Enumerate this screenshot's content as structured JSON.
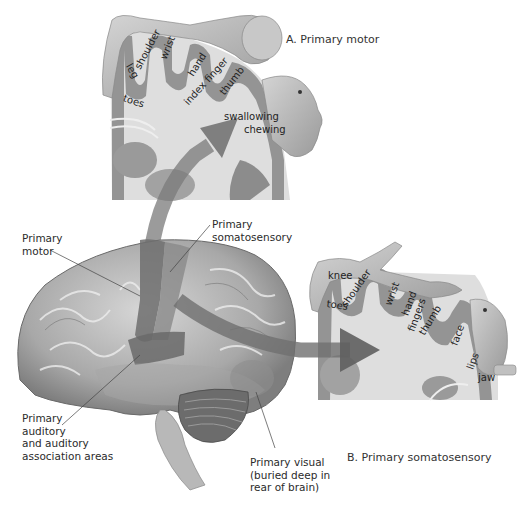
{
  "panel_a": {
    "caption": "A. Primary motor",
    "body_parts": [
      "leg",
      "shoulder",
      "wrist",
      "hand",
      "index finger",
      "thumb",
      "toes",
      "swallowing",
      "chewing"
    ]
  },
  "panel_b": {
    "caption": "B. Primary somatosensory",
    "body_parts": [
      "knee",
      "shoulder",
      "toes",
      "wrist",
      "hand",
      "fingers",
      "thumb",
      "face",
      "lips",
      "jaw"
    ]
  },
  "brain_labels": {
    "primary_motor": [
      "Primary",
      "motor"
    ],
    "primary_somatosensory": [
      "Primary",
      "somatosensory"
    ],
    "primary_auditory": [
      "Primary",
      "auditory",
      "and auditory",
      "association areas"
    ],
    "primary_visual": [
      "Primary visual",
      "(buried deep in",
      "rear of brain)"
    ]
  },
  "colors": {
    "cortex_band": "#8a8a8a",
    "white_matter": "#dcdcdc",
    "brain_surface": "#b9b9b9",
    "motor_strip": "#6d6d6d",
    "arrow": "#6a6a6a"
  }
}
